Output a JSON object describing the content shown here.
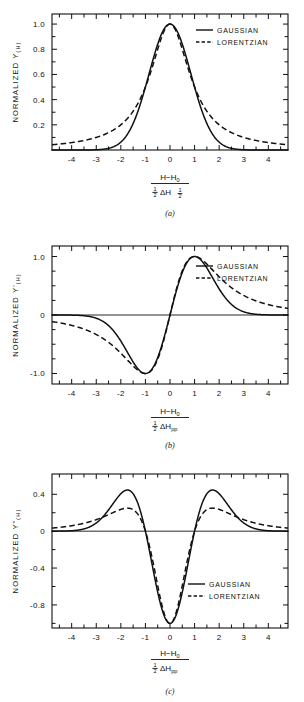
{
  "figure": {
    "legend": {
      "gaussian": "GAUSSIAN",
      "lorentzian": "LORENTZIAN"
    },
    "numerator": "H−H",
    "numerator_sub": "0",
    "half": "1",
    "half_den": "2",
    "delta": "ΔH"
  },
  "panels": [
    {
      "id": "a",
      "caption": "(a)",
      "ylabel": "NORMALIZED  Y",
      "ylabel_sub": "(H)",
      "denominator_sub": "½",
      "xticklabels": [
        "-4",
        "-3",
        "-2",
        "-1",
        "0",
        "1",
        "2",
        "3",
        "4"
      ],
      "yticklabels": [
        "0.2",
        "0.4",
        "0.6",
        "0.8",
        "1.0"
      ],
      "legend_x": 196,
      "legend_y": 30
    },
    {
      "id": "b",
      "caption": "(b)",
      "ylabel": "NORMALIZED  Y'",
      "ylabel_sub": "(H)",
      "denominator_sub": "pp",
      "xticklabels": [
        "-4",
        "-3",
        "-2",
        "-1",
        "0",
        "1",
        "2",
        "3",
        "4"
      ],
      "yticklabels": [
        "1.0",
        "0",
        "-1.0"
      ],
      "legend_x": 196,
      "legend_y": 34
    },
    {
      "id": "c",
      "caption": "(c)",
      "ylabel": "NORMALIZED  Y\"",
      "ylabel_sub": "(H)",
      "denominator_sub": "pp",
      "xticklabels": [
        "-4",
        "-3",
        "-2",
        "-1",
        "0",
        "1",
        "2",
        "3",
        "4"
      ],
      "yticklabels": [
        "0.4",
        "0",
        "-0.4",
        "-0.8"
      ],
      "legend_x": 188,
      "legend_y": 124
    }
  ],
  "chart_data": [
    {
      "type": "line",
      "title": "(a) Normalized absorption lineshape",
      "xlabel": "(H-H0) / (1/2 dH_1/2)",
      "ylabel": "NORMALIZED Y(H)",
      "xlim": [
        -4.8,
        4.8
      ],
      "ylim": [
        0.0,
        1.08
      ],
      "xticks": [
        -4,
        -3,
        -2,
        -1,
        0,
        1,
        2,
        3,
        4
      ],
      "yticks": [
        0.2,
        0.4,
        0.6,
        0.8,
        1.0
      ],
      "grid": false,
      "legend_position": "upper right",
      "series": [
        {
          "name": "GAUSSIAN",
          "style": "solid",
          "x": [
            -4.0,
            -3.5,
            -3.0,
            -2.5,
            -2.0,
            -1.75,
            -1.5,
            -1.25,
            -1.0,
            -0.75,
            -0.5,
            -0.25,
            0.0,
            0.25,
            0.5,
            0.75,
            1.0,
            1.25,
            1.5,
            1.75,
            2.0,
            2.5,
            3.0,
            3.5,
            4.0
          ],
          "values": [
            0.0,
            0.0,
            0.002,
            0.013,
            0.063,
            0.12,
            0.21,
            0.34,
            0.5,
            0.66,
            0.79,
            0.92,
            1.0,
            0.92,
            0.79,
            0.66,
            0.5,
            0.34,
            0.21,
            0.12,
            0.063,
            0.013,
            0.002,
            0.0,
            0.0
          ]
        },
        {
          "name": "LORENTZIAN",
          "style": "dashed",
          "x": [
            -4.0,
            -3.5,
            -3.0,
            -2.5,
            -2.0,
            -1.75,
            -1.5,
            -1.25,
            -1.0,
            -0.75,
            -0.5,
            -0.25,
            0.0,
            0.25,
            0.5,
            0.75,
            1.0,
            1.25,
            1.5,
            1.75,
            2.0,
            2.5,
            3.0,
            3.5,
            4.0
          ],
          "values": [
            0.059,
            0.075,
            0.1,
            0.138,
            0.2,
            0.246,
            0.308,
            0.39,
            0.5,
            0.64,
            0.8,
            0.941,
            1.0,
            0.941,
            0.8,
            0.64,
            0.5,
            0.39,
            0.308,
            0.246,
            0.2,
            0.138,
            0.1,
            0.075,
            0.059
          ]
        }
      ]
    },
    {
      "type": "line",
      "title": "(b) Normalized first-derivative lineshape",
      "xlabel": "(H-H0) / (1/2 dH_pp)",
      "ylabel": "NORMALIZED Y'(H)",
      "xlim": [
        -4.8,
        4.8
      ],
      "ylim": [
        -1.18,
        1.18
      ],
      "xticks": [
        -4,
        -3,
        -2,
        -1,
        0,
        1,
        2,
        3,
        4
      ],
      "yticks": [
        1.0,
        0,
        -1.0
      ],
      "grid": false,
      "legend_position": "upper right",
      "series": [
        {
          "name": "GAUSSIAN",
          "style": "solid",
          "x": [
            -4.0,
            -3.5,
            -3.0,
            -2.5,
            -2.0,
            -1.5,
            -1.0,
            -0.5,
            0.0,
            0.5,
            1.0,
            1.5,
            2.0,
            2.5,
            3.0,
            3.5,
            4.0
          ],
          "values": [
            0.0,
            0.0,
            -0.003,
            -0.03,
            -0.147,
            -0.46,
            -1.0,
            -0.81,
            0.0,
            0.81,
            1.0,
            0.46,
            0.147,
            0.03,
            0.003,
            0.0,
            0.0
          ]
        },
        {
          "name": "LORENTZIAN",
          "style": "dashed",
          "x": [
            -4.0,
            -3.5,
            -3.0,
            -2.5,
            -2.0,
            -1.5,
            -1.0,
            -0.5,
            0.0,
            0.5,
            1.0,
            1.5,
            2.0,
            2.5,
            3.0,
            3.5,
            4.0
          ],
          "values": [
            -0.087,
            -0.113,
            -0.152,
            -0.214,
            -0.312,
            -0.472,
            -1.0,
            -0.877,
            0.0,
            0.877,
            1.0,
            0.472,
            0.312,
            0.214,
            0.152,
            0.113,
            0.087
          ]
        }
      ],
      "note": "Gaussian extrema at x=-1 (+1.0) and x=+1 (-1.0); zero crossing at x=0"
    },
    {
      "type": "line",
      "title": "(c) Normalized second-derivative lineshape",
      "xlabel": "(H-H0) / (1/2 dH_pp)",
      "ylabel": "NORMALIZED Y\"(H)",
      "xlim": [
        -4.8,
        4.8
      ],
      "ylim": [
        -1.05,
        0.62
      ],
      "xticks": [
        -4,
        -3,
        -2,
        -1,
        0,
        1,
        2,
        3,
        4
      ],
      "yticks": [
        0.4,
        0,
        -0.4,
        -0.8
      ],
      "grid": false,
      "legend_position": "center right",
      "series": [
        {
          "name": "GAUSSIAN",
          "style": "solid",
          "x": [
            -4.0,
            -3.5,
            -3.0,
            -2.5,
            -2.0,
            -1.73,
            -1.5,
            -1.0,
            -0.5,
            0.0,
            0.5,
            1.0,
            1.5,
            1.73,
            2.0,
            2.5,
            3.0,
            3.5,
            4.0
          ],
          "values": [
            0.0,
            0.001,
            0.01,
            0.06,
            0.3,
            0.5,
            0.45,
            0.0,
            -0.62,
            -1.0,
            -0.62,
            0.0,
            0.45,
            0.5,
            0.3,
            0.06,
            0.01,
            0.001,
            0.0
          ],
          "peak": 0.5,
          "peak_x": [
            -1.73,
            1.73
          ],
          "minimum": -1.0,
          "minimum_x": 0.0
        },
        {
          "name": "LORENTZIAN",
          "style": "dashed",
          "x": [
            -4.0,
            -3.5,
            -3.0,
            -2.5,
            -2.0,
            -1.9,
            -1.5,
            -1.0,
            -0.5,
            0.0,
            0.5,
            1.0,
            1.5,
            1.9,
            2.0,
            2.5,
            3.0,
            3.5,
            4.0
          ],
          "values": [
            0.042,
            0.057,
            0.085,
            0.13,
            0.205,
            0.22,
            0.2,
            0.0,
            -0.55,
            -1.0,
            -0.55,
            0.0,
            0.2,
            0.22,
            0.205,
            0.13,
            0.085,
            0.057,
            0.042
          ],
          "peak": 0.22,
          "peak_x": [
            -1.9,
            1.9
          ],
          "minimum": -1.0,
          "minimum_x": 0.0
        }
      ]
    }
  ]
}
